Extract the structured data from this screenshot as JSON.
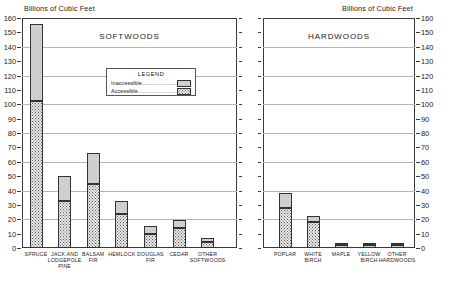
{
  "figure": {
    "axis_caption_left": "Billions of Cubic Feet",
    "axis_caption_right": "Billions of Cubic Feet",
    "legend_title": "LEGEND",
    "legend_inaccessible_label": "Inaccessible",
    "legend_accessible_label": "Accessible",
    "legend_leader_dots": "..........................",
    "colors": {
      "inaccessible": "#cfcfcf",
      "accessible": "#e8e8e8",
      "accessible_stipple": "#5a5a5a",
      "frame": "#3a3a3a",
      "gridline": "#b4b4b4",
      "text": "#1a1a1a"
    }
  },
  "chart_data": [
    {
      "type": "bar",
      "title": "SOFTWOODS",
      "xlabel": "",
      "ylabel": "Billions of Cubic Feet",
      "ylim": [
        0,
        160
      ],
      "ytick_step": 10,
      "yticks": [
        0,
        10,
        20,
        30,
        40,
        50,
        60,
        70,
        80,
        90,
        100,
        110,
        120,
        130,
        140,
        150,
        160
      ],
      "gridlines": [
        20,
        40,
        60,
        80,
        100,
        120,
        140
      ],
      "grid": true,
      "stacked": true,
      "legend_position": "inside-top-center",
      "categories": [
        "SPRUCE",
        "JACK AND LODGEPOLE PINE",
        "BALSAM FIR",
        "HEMLOCK",
        "DOUGLAS FIR",
        "CEDAR",
        "OTHER SOFTWOODS"
      ],
      "category_lines": [
        [
          "SPRUCE"
        ],
        [
          "JACK AND",
          "LODGEPOLE",
          "PINE"
        ],
        [
          "BALSAM",
          "FIR"
        ],
        [
          "HEMLOCK"
        ],
        [
          "DOUGLAS",
          "FIR"
        ],
        [
          "CEDAR"
        ],
        [
          "OTHER",
          "SOFTWOODS"
        ]
      ],
      "series": [
        {
          "name": "Accessible",
          "values": [
            102,
            33,
            44.5,
            24,
            9.5,
            14,
            4
          ]
        },
        {
          "name": "Inaccessible",
          "values": [
            54,
            17,
            21.5,
            9,
            5.5,
            5.5,
            3
          ]
        }
      ],
      "totals": [
        156,
        50,
        66,
        33,
        15,
        19.5,
        7
      ]
    },
    {
      "type": "bar",
      "title": "HARDWOODS",
      "xlabel": "",
      "ylabel": "Billions of Cubic Feet",
      "ylim": [
        0,
        160
      ],
      "ytick_step": 10,
      "yticks": [
        0,
        10,
        20,
        30,
        40,
        50,
        60,
        70,
        80,
        90,
        100,
        110,
        120,
        130,
        140,
        150,
        160
      ],
      "gridlines": [
        20,
        40,
        60,
        80,
        100,
        120,
        140
      ],
      "grid": true,
      "stacked": true,
      "legend_position": "inside-top-center",
      "categories": [
        "POPLAR",
        "WHITE BIRCH",
        "MAPLE",
        "YELLOW BIRCH",
        "OTHER HARDWOODS"
      ],
      "category_lines": [
        [
          "POPLAR"
        ],
        [
          "WHITE",
          "BIRCH"
        ],
        [
          "MAPLE"
        ],
        [
          "YELLOW",
          "BIRCH"
        ],
        [
          "OTHER",
          "HARDWOODS"
        ]
      ],
      "series": [
        {
          "name": "Accessible",
          "values": [
            28,
            18,
            2,
            2,
            2
          ]
        },
        {
          "name": "Inaccessible",
          "values": [
            10,
            4,
            1,
            1,
            1
          ]
        }
      ],
      "totals": [
        38,
        22,
        3,
        3,
        3
      ]
    }
  ]
}
